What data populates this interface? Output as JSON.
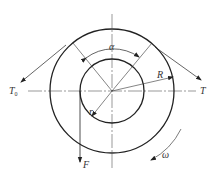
{
  "diagram": {
    "type": "belt-friction-pulley",
    "labels": {
      "alpha": "α",
      "R": "R",
      "r": "r",
      "T": "T",
      "T0_main": "T",
      "T0_sub": "0",
      "F": "F",
      "omega": "ω"
    },
    "geometry": {
      "center": [
        112,
        91
      ],
      "outer_radius": 62,
      "inner_radius": 32
    },
    "colors": {
      "stroke": "#222222",
      "centerline": "#555555"
    }
  }
}
